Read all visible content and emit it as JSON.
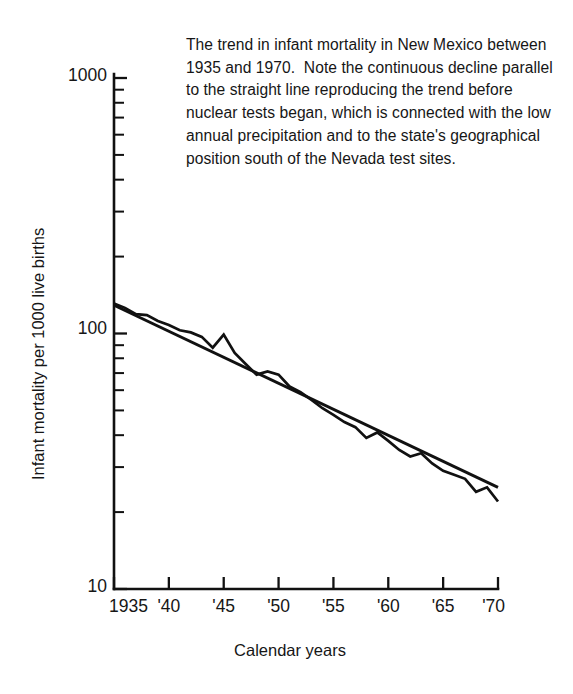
{
  "caption": {
    "text": "The trend in infant mortality in New Mexico between 1935 and 1970.  Note the continuous decline parallel to the straight line reproducing the trend before nuclear tests began, which is connected with the low annual precipitation and to the state's geographical position south of the Nevada test sites."
  },
  "chart_data": {
    "type": "line",
    "title": "",
    "xlabel": "Calendar years",
    "ylabel": "Infant mortality per 1000 live births",
    "xlim": [
      1935,
      1970
    ],
    "ylim": [
      10,
      1000
    ],
    "yscale": "log",
    "grid": false,
    "legend": "none",
    "y_major_ticks": [
      "10",
      "100",
      "1000"
    ],
    "y_major_values": [
      10,
      100,
      1000
    ],
    "y_minor_values": [
      20,
      30,
      40,
      50,
      60,
      70,
      80,
      90,
      200,
      300,
      400,
      500,
      600,
      700,
      800,
      900
    ],
    "x_tick_labels": [
      "1935",
      "'40",
      "'45",
      "'50",
      "'55",
      "'60",
      "'65",
      "'70"
    ],
    "x_tick_values": [
      1935,
      1940,
      1945,
      1950,
      1955,
      1960,
      1965,
      1970
    ],
    "series": [
      {
        "name": "Infant mortality (observed)",
        "x": [
          1935,
          1936,
          1937,
          1938,
          1939,
          1940,
          1941,
          1942,
          1943,
          1944,
          1945,
          1946,
          1947,
          1948,
          1949,
          1950,
          1951,
          1952,
          1953,
          1954,
          1955,
          1956,
          1957,
          1958,
          1959,
          1960,
          1961,
          1962,
          1963,
          1964,
          1965,
          1966,
          1967,
          1968,
          1969,
          1970
        ],
        "y": [
          131,
          126,
          119,
          118,
          112,
          108,
          103,
          101,
          97,
          88,
          99,
          84,
          76,
          69,
          71,
          69,
          62,
          59,
          55,
          51,
          48,
          45,
          43,
          39,
          41,
          38,
          35,
          33,
          34,
          31,
          29,
          28,
          27,
          24,
          25,
          22
        ]
      },
      {
        "name": "Pre-nuclear-test trend line",
        "type": "straight",
        "x": [
          1935,
          1970
        ],
        "y": [
          129,
          25
        ]
      }
    ],
    "annotations": [
      {
        "text": "peak at 1945",
        "x": 1945,
        "y": 99
      }
    ]
  }
}
